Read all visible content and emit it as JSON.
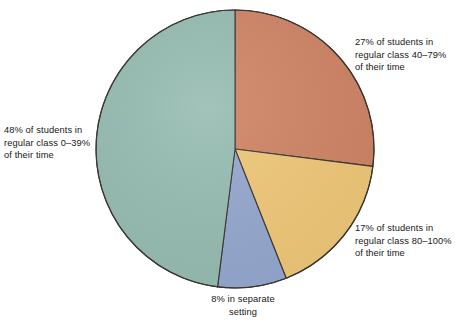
{
  "chart_data": {
    "type": "pie",
    "title": "",
    "subtitle": "",
    "xlabel": "",
    "ylabel": "",
    "legend_position": "callout-labels",
    "grid": false,
    "start_angle_deg": 0,
    "direction": "clockwise",
    "categories": [
      "27% of students in regular class 40–79% of their time",
      "17% of students in regular class 80–100% of their time",
      "8% in separate setting",
      "48% of students in regular class 0–39% of their time"
    ],
    "values": [
      27,
      17,
      8,
      48
    ],
    "units": "percent",
    "slices": [
      {
        "id": "slice-40-79",
        "value": 27,
        "value_text": "27%",
        "color": "#d08465",
        "label_lines": [
          "27% of students in",
          "regular class 40–79%",
          "of their time"
        ],
        "label_text": "27% of students in\nregular class 40–79%\nof their time",
        "label_position": "top-right"
      },
      {
        "id": "slice-80-100",
        "value": 17,
        "value_text": "17%",
        "color": "#f0c878",
        "label_lines": [
          "17% of students in",
          "regular class 80–100%",
          "of their time"
        ],
        "label_text": "17% of students in\nregular class 80–100%\nof their time",
        "label_position": "bottom-right"
      },
      {
        "id": "slice-separate-setting",
        "value": 8,
        "value_text": "8%",
        "color": "#95a8cf",
        "label_lines": [
          "8% in separate",
          "setting"
        ],
        "label_text": "8% in separate\nsetting",
        "label_position": "bottom"
      },
      {
        "id": "slice-0-39",
        "value": 48,
        "value_text": "48%",
        "color": "#97bdb2",
        "label_lines": [
          "48% of students in",
          "regular class 0–39%",
          "of their time"
        ],
        "label_text": "48% of students in\nregular class 0–39%\nof their time",
        "label_position": "left"
      }
    ],
    "colors": {
      "slice_40_79": "#d08465",
      "slice_80_100": "#f0c878",
      "slice_separate": "#95a8cf",
      "slice_0_39": "#97bdb2",
      "outline": "#3a3632",
      "background": "#ffffff",
      "text": "#171717"
    }
  },
  "labels": {
    "left": "48% of students in\nregular class 0–39%\nof their time",
    "top_right": "27% of students in\nregular class 40–79%\nof their time",
    "bottom_right": "17% of students in\nregular class 80–100%\nof their time",
    "bottom": "8% in separate\nsetting"
  }
}
